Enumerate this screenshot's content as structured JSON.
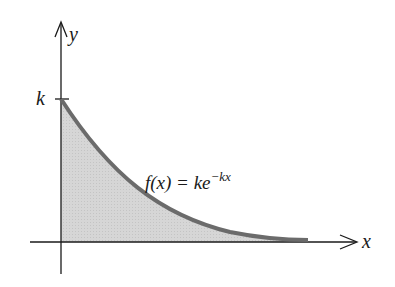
{
  "diagram": {
    "type": "function-graph",
    "axes": {
      "x_label": "x",
      "y_label": "y"
    },
    "ticks": {
      "y_tick_label": "k"
    },
    "curve": {
      "label_prefix": "f(x) = ke",
      "label_exponent": "−kx",
      "description": "exponential decay starting at (0, k), area under curve shaded",
      "stroke_color": "#6b6b6b",
      "fill_color": "#d4d4d4"
    },
    "colors": {
      "axis": "#1a1a1a",
      "background": "#ffffff"
    }
  }
}
